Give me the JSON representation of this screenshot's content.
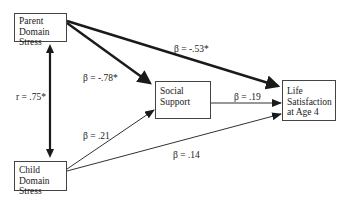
{
  "nodes": {
    "parent_stress": {
      "lines": [
        "Parent",
        "Domain",
        "Stress"
      ]
    },
    "child_stress": {
      "lines": [
        "Child",
        "Domain",
        "Stress"
      ]
    },
    "social_support": {
      "lines": [
        "Social",
        "Support"
      ]
    },
    "life_satisfaction": {
      "lines": [
        "Life",
        "Satisfaction",
        "at Age 4"
      ]
    }
  },
  "edges": {
    "parent_child_corr": {
      "from": "Parent Domain Stress",
      "to": "Child Domain Stress",
      "type": "bidirectional",
      "label": "r = .75*",
      "weight": "bold"
    },
    "parent_to_support": {
      "from": "Parent Domain Stress",
      "to": "Social Support",
      "label": "β = -.78*",
      "weight": "bold"
    },
    "parent_to_life": {
      "from": "Parent Domain Stress",
      "to": "Life Satisfaction at Age 4",
      "label": "β = -.53*",
      "weight": "bold"
    },
    "child_to_support": {
      "from": "Child Domain Stress",
      "to": "Social Support",
      "label": "β = .21",
      "weight": "thin"
    },
    "child_to_life": {
      "from": "Child Domain Stress",
      "to": "Life Satisfaction at Age 4",
      "label": "β = .14",
      "weight": "thin"
    },
    "support_to_life": {
      "from": "Social Support",
      "to": "Life Satisfaction at Age 4",
      "label": "β = .19",
      "weight": "thin"
    }
  }
}
